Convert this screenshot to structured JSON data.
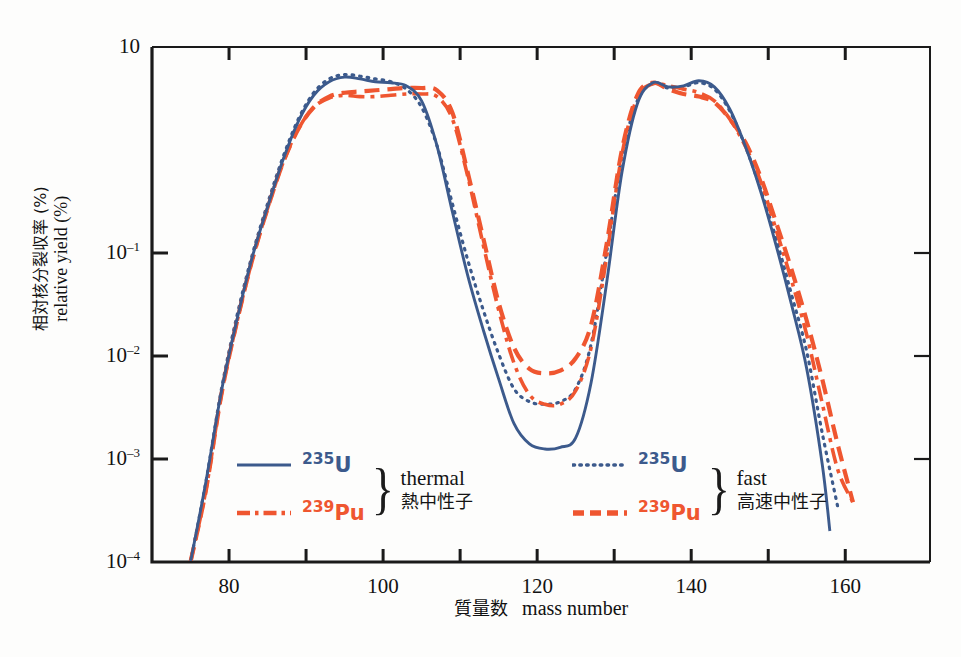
{
  "chart_data": {
    "type": "line",
    "title": "",
    "xlabel_jp": "質量数",
    "xlabel_en": "mass number",
    "ylabel_jp": "相対核分裂収率(%)",
    "ylabel_en": "relative yield (%)",
    "xlim": [
      70,
      171
    ],
    "ylim": [
      0.0001,
      10
    ],
    "yscale": "log",
    "xticks": [
      80,
      90,
      100,
      110,
      120,
      130,
      140,
      150,
      160
    ],
    "xtick_labels": [
      "80",
      "",
      "100",
      "",
      "120",
      "",
      "140",
      "",
      "160"
    ],
    "ytick_labels": [
      "10",
      "10⁻¹",
      "10⁻²",
      "10⁻³",
      "10⁻⁴"
    ],
    "ytick_values": [
      10,
      0.1,
      0.01,
      0.001,
      0.0001
    ],
    "grid": false,
    "legend_position": "inside-bottom",
    "series": [
      {
        "name": "U-235 thermal",
        "nuclide_mass": "235",
        "nuclide_symbol": "U",
        "neutron_en": "thermal",
        "neutron_jp": "熱中性子",
        "color": "#3c5a8c",
        "style": "solid",
        "x": [
          75,
          77,
          79,
          81,
          83,
          85,
          87,
          89,
          91,
          93,
          95,
          97,
          99,
          101,
          103,
          105,
          107,
          109,
          111,
          113,
          115,
          117,
          119,
          121,
          123,
          125,
          127,
          129,
          131,
          133,
          135,
          137,
          139,
          141,
          143,
          145,
          147,
          149,
          151,
          153,
          155,
          157,
          158
        ],
        "y": [
          0.0001,
          0.0006,
          0.0045,
          0.022,
          0.09,
          0.28,
          0.8,
          1.9,
          3.4,
          4.6,
          5.1,
          4.9,
          4.6,
          4.5,
          4.2,
          3.0,
          1.1,
          0.25,
          0.06,
          0.018,
          0.006,
          0.0022,
          0.0014,
          0.00125,
          0.0013,
          0.0016,
          0.0055,
          0.05,
          0.6,
          2.8,
          4.5,
          4.1,
          4.2,
          4.7,
          4.1,
          2.5,
          1.1,
          0.4,
          0.12,
          0.032,
          0.0075,
          0.0009,
          0.0002
        ]
      },
      {
        "name": "Pu-239 thermal",
        "nuclide_mass": "239",
        "nuclide_symbol": "Pu",
        "neutron_en": "thermal",
        "neutron_jp": "熱中性子",
        "color": "#ef5630",
        "style": "dashdot",
        "x": [
          75,
          77,
          79,
          81,
          83,
          85,
          87,
          89,
          91,
          93,
          95,
          97,
          99,
          101,
          103,
          105,
          107,
          109,
          111,
          113,
          115,
          117,
          119,
          121,
          123,
          125,
          127,
          129,
          131,
          133,
          135,
          137,
          139,
          141,
          143,
          145,
          147,
          149,
          151,
          153,
          155,
          157,
          159,
          161
        ],
        "y": [
          0.0001,
          0.0005,
          0.0042,
          0.021,
          0.085,
          0.27,
          0.75,
          1.6,
          2.6,
          3.2,
          3.4,
          3.3,
          3.3,
          3.4,
          3.5,
          3.5,
          3.3,
          2.0,
          0.55,
          0.12,
          0.028,
          0.0085,
          0.0042,
          0.0034,
          0.0034,
          0.0046,
          0.012,
          0.09,
          0.9,
          3.2,
          4.4,
          4.2,
          3.9,
          3.6,
          3.0,
          2.0,
          1.1,
          0.5,
          0.17,
          0.055,
          0.016,
          0.0035,
          0.0008,
          0.00038
        ]
      },
      {
        "name": "U-235 fast",
        "nuclide_mass": "235",
        "nuclide_symbol": "U",
        "neutron_en": "fast",
        "neutron_jp": "高速中性子",
        "color": "#3c5a8c",
        "style": "dotted",
        "x": [
          75,
          77,
          79,
          81,
          83,
          85,
          87,
          89,
          91,
          93,
          95,
          97,
          99,
          101,
          103,
          105,
          107,
          109,
          111,
          113,
          115,
          117,
          119,
          121,
          123,
          125,
          127,
          129,
          131,
          133,
          135,
          137,
          139,
          141,
          143,
          145,
          147,
          149,
          151,
          153,
          155,
          157,
          159
        ],
        "y": [
          0.0001,
          0.0006,
          0.0047,
          0.024,
          0.095,
          0.3,
          0.85,
          2.0,
          3.6,
          4.9,
          5.4,
          5.2,
          4.9,
          4.6,
          3.9,
          2.6,
          1.1,
          0.3,
          0.085,
          0.028,
          0.0105,
          0.0048,
          0.0036,
          0.0034,
          0.0036,
          0.0048,
          0.013,
          0.1,
          0.85,
          3.0,
          4.4,
          4.0,
          4.1,
          4.5,
          3.9,
          2.4,
          1.1,
          0.42,
          0.14,
          0.04,
          0.011,
          0.0018,
          0.00035
        ]
      },
      {
        "name": "Pu-239 fast",
        "nuclide_mass": "239",
        "nuclide_symbol": "Pu",
        "neutron_en": "fast",
        "neutron_jp": "高速中性子",
        "color": "#ef5630",
        "style": "dashed",
        "x": [
          75,
          77,
          79,
          81,
          83,
          85,
          87,
          89,
          91,
          93,
          95,
          97,
          99,
          101,
          103,
          105,
          107,
          109,
          111,
          113,
          115,
          117,
          119,
          121,
          123,
          125,
          127,
          129,
          131,
          133,
          135,
          137,
          139,
          141,
          143,
          145,
          147,
          149,
          151,
          153,
          155,
          157,
          159,
          161
        ],
        "y": [
          0.0001,
          0.0005,
          0.0042,
          0.021,
          0.085,
          0.27,
          0.75,
          1.6,
          2.6,
          3.3,
          3.6,
          3.7,
          3.8,
          3.9,
          4.0,
          4.0,
          3.8,
          2.3,
          0.6,
          0.14,
          0.033,
          0.012,
          0.0075,
          0.0068,
          0.0072,
          0.0095,
          0.02,
          0.12,
          1.0,
          3.4,
          4.5,
          3.9,
          3.5,
          3.3,
          2.9,
          2.0,
          1.2,
          0.55,
          0.2,
          0.07,
          0.022,
          0.006,
          0.0014,
          0.00038
        ]
      }
    ]
  },
  "axes": {
    "y_ticks": [
      {
        "mantissa": "10",
        "exp": ""
      },
      {
        "mantissa": "10",
        "exp": "–1"
      },
      {
        "mantissa": "10",
        "exp": "–2"
      },
      {
        "mantissa": "10",
        "exp": "–3"
      },
      {
        "mantissa": "10",
        "exp": "–4"
      }
    ],
    "x_ticks": [
      "80",
      "100",
      "120",
      "140",
      "160"
    ],
    "x_title_jp": "質量数",
    "x_title_en": "mass number",
    "y_title_jp": "相対核分裂収率 (%)",
    "y_title_en": "relative yield (%)"
  },
  "legend": {
    "thermal": {
      "entries": [
        {
          "mass": "235",
          "symbol": "U",
          "color": "#3c5a8c",
          "style": "solid"
        },
        {
          "mass": "239",
          "symbol": "Pu",
          "color": "#ef5630",
          "style": "dashdot"
        }
      ],
      "condition_en": "thermal",
      "condition_jp": "熱中性子",
      "brace": "}"
    },
    "fast": {
      "entries": [
        {
          "mass": "235",
          "symbol": "U",
          "color": "#3c5a8c",
          "style": "dotted"
        },
        {
          "mass": "239",
          "symbol": "Pu",
          "color": "#ef5630",
          "style": "dashed"
        }
      ],
      "condition_en": "fast",
      "condition_jp": "高速中性子",
      "brace": "}"
    }
  },
  "colors": {
    "uranium": "#3c5a8c",
    "plutonium": "#ef5630",
    "axis": "#1a1a1a",
    "background": "#fdfdfc"
  }
}
